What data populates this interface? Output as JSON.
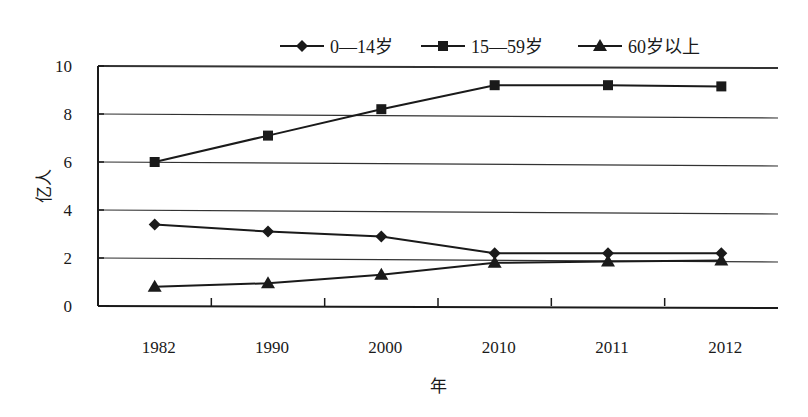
{
  "chart_data": {
    "type": "line",
    "title": "",
    "xlabel": "年",
    "ylabel": "亿人",
    "categories": [
      "1982",
      "1990",
      "2000",
      "2010",
      "2011",
      "2012"
    ],
    "ylim": [
      0,
      10
    ],
    "yticks": [
      "0",
      "2",
      "4",
      "6",
      "8",
      "10"
    ],
    "grid": true,
    "legend_position": "top",
    "series": [
      {
        "name": "0—14岁",
        "marker": "diamond",
        "values": [
          3.4,
          3.1,
          2.9,
          2.2,
          2.2,
          2.2
        ]
      },
      {
        "name": "15—59岁",
        "marker": "square",
        "values": [
          6.0,
          7.1,
          8.2,
          9.2,
          9.2,
          9.15
        ]
      },
      {
        "name": "60岁以上",
        "marker": "triangle",
        "values": [
          0.8,
          0.95,
          1.3,
          1.8,
          1.85,
          1.9
        ]
      }
    ]
  },
  "colors": {
    "line": "#1a1a1a",
    "grid": "#333333",
    "background": "#ffffff"
  }
}
